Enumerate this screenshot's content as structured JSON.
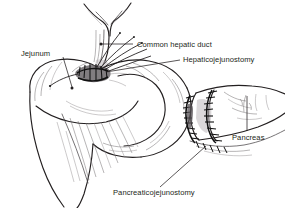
{
  "figure": {
    "background_color": "#ffffff",
    "ink_color": "#231f20",
    "style": "pen-and-ink medical line drawing",
    "width": 285,
    "height": 208
  },
  "labels": [
    {
      "id": "jejunum",
      "text": "Jejunum",
      "text_x": 21,
      "text_y": 56,
      "anchor": "start",
      "leader": "M 63 57 L 72 87",
      "dot_x": 72,
      "dot_y": 88,
      "has_dot": true
    },
    {
      "id": "common-hepatic-duct",
      "text": "Common hepatic duct",
      "text_x": 137,
      "text_y": 47,
      "anchor": "start",
      "leader": "M 102 44 L 133 44",
      "dot_x": 101,
      "dot_y": 44,
      "has_dot": true
    },
    {
      "id": "hepaticojejunostomy",
      "text": "Hepaticojejunostomy",
      "text_x": 183,
      "text_y": 62,
      "anchor": "start",
      "leader": "M 180 60 L 106 72",
      "dot_x": 0,
      "dot_y": 0,
      "has_dot": false
    },
    {
      "id": "pancreas",
      "text": "Pancreas",
      "text_x": 232,
      "text_y": 140,
      "anchor": "start",
      "leader": "M 247 96 L 247 131",
      "dot_x": 0,
      "dot_y": 0,
      "has_dot": false
    },
    {
      "id": "pancreaticojejunostomy",
      "text": "Pancreaticojejunostomy",
      "text_x": 113,
      "text_y": 195,
      "anchor": "start",
      "leader": "M 160 187 L 206 146",
      "dot_x": 0,
      "dot_y": 0,
      "has_dot": false
    }
  ],
  "structures": [
    {
      "id": "common-hepatic-duct-tube",
      "name": "Common hepatic duct",
      "description": "Y-shaped bifurcating duct descending from top center"
    },
    {
      "id": "jejunal-limb",
      "name": "Jejunal limb",
      "description": "Large rounded bowel loop occupying left and center"
    },
    {
      "id": "mesentery",
      "name": "Mesentery",
      "description": "Fan of fine vessel striations below the bowel loop"
    },
    {
      "id": "pancreas-stump",
      "name": "Pancreatic remnant",
      "description": "Cylindrical cut pancreas entering from the right"
    },
    {
      "id": "hepaticojejunostomy-anastomosis",
      "name": "Hepaticojejunostomy",
      "description": "Dense sutured anastomosis between duct and jejunum"
    },
    {
      "id": "pancreaticojejunostomy-anastomosis",
      "name": "Pancreaticojejunostomy",
      "description": "Two interrupted suture rings joining pancreas to jejunum"
    }
  ]
}
